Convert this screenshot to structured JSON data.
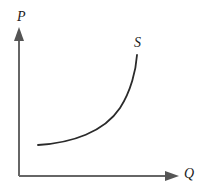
{
  "figure": {
    "background_color": "#ffffff",
    "axis_color": "#666666",
    "curve_color": "#2a2a2a",
    "label_color": "#1c1c1c"
  },
  "axes": {
    "vertical": {
      "label": "P",
      "meaning": "Price",
      "arrow": "up-arrow-icon",
      "origin": [
        19,
        176
      ],
      "tip": [
        19,
        28
      ]
    },
    "horizontal": {
      "label": "Q",
      "meaning": "Quantity",
      "arrow": "right-arrow-icon",
      "origin": [
        19,
        176
      ],
      "tip": [
        178,
        176
      ]
    }
  },
  "curve": {
    "label": "S",
    "meaning": "Supply",
    "shape": "upward-sloping-convex",
    "path": "M 38 145 C 72 143, 104 132, 120 108 C 131 91, 136 70, 137 55"
  },
  "chart_data": {
    "type": "line",
    "title": "",
    "xlabel": "Q",
    "ylabel": "P",
    "legend": [
      "S"
    ],
    "legend_position": "curve-end-top",
    "grid": false,
    "xlim": [
      0,
      10
    ],
    "ylim": [
      0,
      10
    ],
    "series": [
      {
        "name": "S",
        "annotation": "S",
        "x": [
          1.2,
          2.0,
          3.0,
          4.0,
          5.0,
          5.8,
          6.5,
          7.0,
          7.4
        ],
        "y": [
          2.1,
          2.3,
          2.7,
          3.3,
          4.3,
          5.3,
          6.6,
          7.6,
          8.2
        ]
      }
    ]
  }
}
